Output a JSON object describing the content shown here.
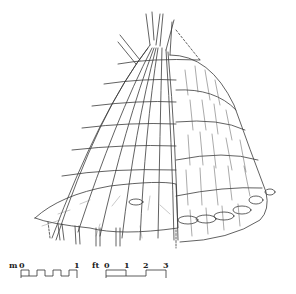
{
  "scale_bars": {
    "metric": {
      "unit": "m",
      "ticks": [
        "0",
        "1"
      ]
    },
    "imperial": {
      "unit": "ft",
      "ticks": [
        "0",
        "1",
        "2",
        "3"
      ]
    }
  },
  "colors": {
    "ink": "#333333",
    "background": "#ffffff"
  }
}
